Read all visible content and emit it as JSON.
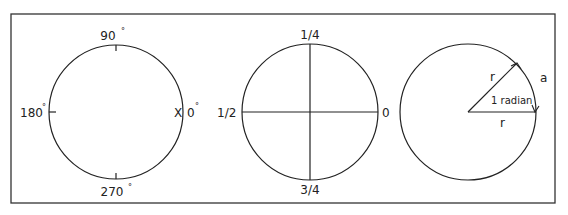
{
  "diagram": {
    "colors": {
      "stroke": "#222222",
      "background": "#ffffff"
    },
    "panels": [
      {
        "name": "degrees",
        "labels": {
          "top": "90",
          "left": "180",
          "right": "0",
          "bottom": "270",
          "degree_symbol": "°",
          "marker": "X"
        }
      },
      {
        "name": "turns",
        "labels": {
          "top": "1/4",
          "left": "1/2",
          "right": "0",
          "bottom": "3/4"
        }
      },
      {
        "name": "radian",
        "labels": {
          "radius_upper": "r",
          "radius_lower": "r",
          "arc": "a",
          "angle": "1 radian"
        }
      }
    ]
  }
}
